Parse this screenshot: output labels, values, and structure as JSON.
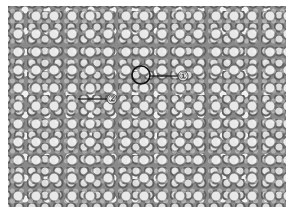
{
  "figure": {
    "type": "grayscale micrograph of cellular tissue",
    "annotations": [
      {
        "id": 1,
        "label": "①",
        "target": "circled cell",
        "circle_center": [
          141,
          75
        ],
        "circle_radius": 9,
        "label_pos": [
          183,
          76
        ]
      },
      {
        "id": 2,
        "label": "②",
        "target": "cell wall region",
        "line_start": [
          78,
          99
        ],
        "label_pos": [
          112,
          99
        ]
      }
    ],
    "colors": {
      "background": "#ffffff",
      "annotation_stroke": "#111111",
      "tissue_mid": "#8a8a8a"
    }
  }
}
